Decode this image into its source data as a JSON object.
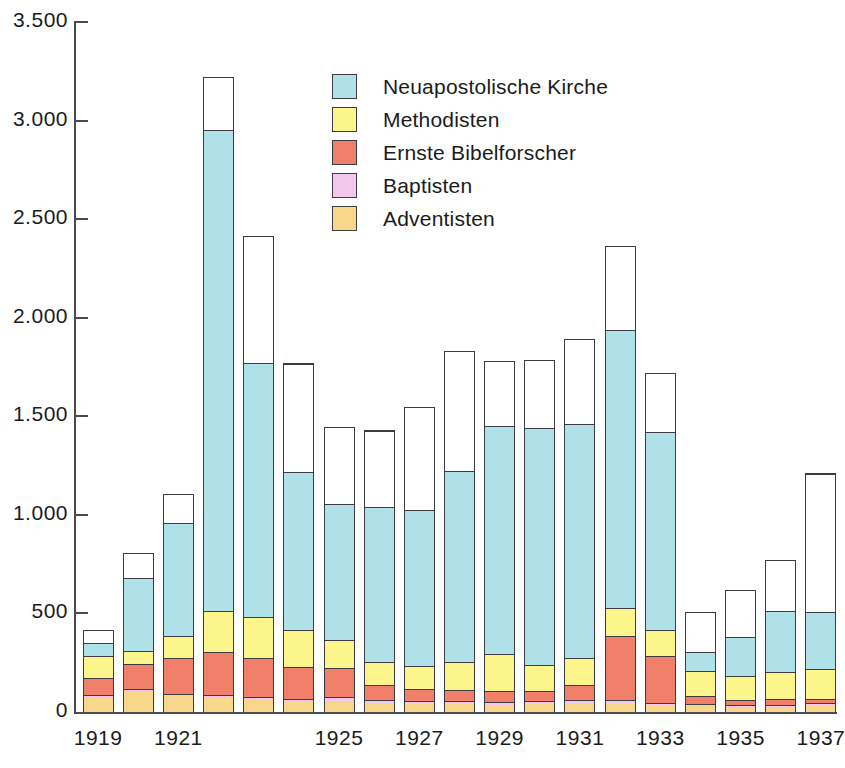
{
  "chart_data": {
    "type": "bar",
    "stacked": true,
    "title": "",
    "xlabel": "",
    "ylabel": "",
    "ylim": [
      0,
      3500
    ],
    "yticks": [
      0,
      500,
      1000,
      1500,
      2000,
      2500,
      3000,
      3500
    ],
    "ytick_labels": [
      "0",
      "500",
      "1.000",
      "1.500",
      "2.000",
      "2.500",
      "3.000",
      "3.500"
    ],
    "grid": false,
    "legend_position": "upper center",
    "categories": [
      "1919",
      "1920",
      "1921",
      "1922",
      "1923",
      "1924",
      "1925",
      "1926",
      "1927",
      "1928",
      "1929",
      "1930",
      "1931",
      "1932",
      "1933",
      "1934",
      "1935",
      "1936",
      "1937"
    ],
    "xtick_labels": [
      "1919",
      "",
      "1921",
      "",
      "",
      "",
      "1925",
      "",
      "1927",
      "",
      "1929",
      "",
      "1931",
      "",
      "1933",
      "",
      "1935",
      "",
      "1937"
    ],
    "series": [
      {
        "name": "Adventisten",
        "color": "#f8d68a",
        "values": [
          78,
          108,
          82,
          72,
          62,
          56,
          52,
          45,
          42,
          40,
          38,
          40,
          44,
          40,
          30,
          28,
          25,
          26,
          32
        ]
      },
      {
        "name": "Baptisten",
        "color": "#f2c8ee",
        "values": [
          6,
          8,
          10,
          16,
          14,
          12,
          22,
          18,
          16,
          14,
          12,
          14,
          18,
          20,
          16,
          12,
          10,
          12,
          14
        ]
      },
      {
        "name": "Ernste Bibelforscher",
        "color": "#f0806a",
        "values": [
          88,
          130,
          180,
          215,
          196,
          160,
          150,
          74,
          58,
          56,
          56,
          54,
          74,
          325,
          240,
          40,
          26,
          30,
          22
        ]
      },
      {
        "name": "Methodisten",
        "color": "#fbf58c",
        "values": [
          112,
          62,
          116,
          209,
          212,
          188,
          140,
          116,
          120,
          145,
          190,
          133,
          137,
          142,
          132,
          128,
          121,
          135,
          152
        ]
      },
      {
        "name": "Neuapostolische Kirche",
        "color": "#b0e0e8",
        "values": [
          66,
          372,
          573,
          2438,
          1288,
          800,
          690,
          785,
          790,
          970,
          1155,
          1200,
          1190,
          1410,
          1000,
          98,
          198,
          310,
          290
        ]
      },
      {
        "name": "Sonstige",
        "color": "#ffffff",
        "values": [
          66,
          125,
          145,
          270,
          645,
          552,
          390,
          390,
          520,
          605,
          330,
          345,
          430,
          425,
          300,
          200,
          240,
          260,
          700
        ]
      }
    ],
    "totals": [
      416,
      805,
      1106,
      3220,
      2417,
      1768,
      1444,
      1428,
      1546,
      1830,
      1781,
      1786,
      1893,
      2362,
      1718,
      506,
      620,
      773,
      1210
    ]
  },
  "legend": {
    "items": [
      {
        "label": "Neuapostolische Kirche",
        "color": "#b0e0e8"
      },
      {
        "label": "Methodisten",
        "color": "#fbf58c"
      },
      {
        "label": "Ernste Bibelforscher",
        "color": "#f0806a"
      },
      {
        "label": "Baptisten",
        "color": "#f2c8ee"
      },
      {
        "label": "Adventisten",
        "color": "#f8d68a"
      }
    ]
  },
  "axis_color": "#4a4a50",
  "bar_outline_color": "#3c3c42"
}
